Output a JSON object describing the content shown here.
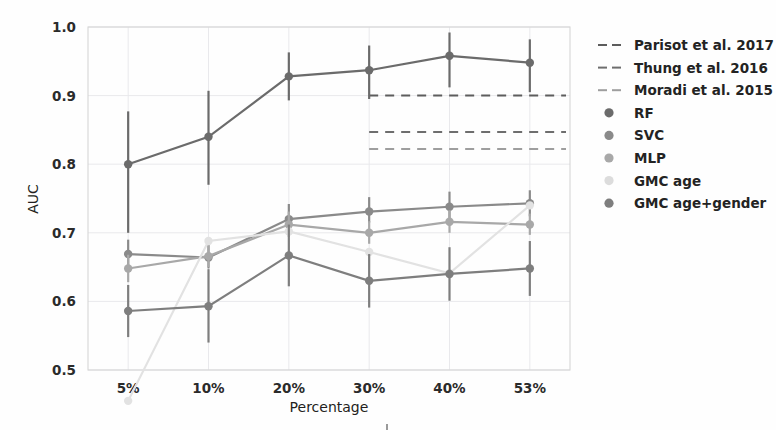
{
  "chart_data": {
    "type": "line",
    "title": "",
    "xlabel": "Percentage",
    "ylabel": "AUC",
    "categories": [
      "5%",
      "10%",
      "20%",
      "30%",
      "40%",
      "53%"
    ],
    "ylim": [
      0.5,
      1.0
    ],
    "yticks": [
      "0.5",
      "0.6",
      "0.7",
      "0.8",
      "0.9",
      "1.0"
    ],
    "ytick_values": [
      0.5,
      0.6,
      0.7,
      0.8,
      0.9,
      1.0
    ],
    "grid": true,
    "legend_position": "right-outside",
    "series": [
      {
        "name": "RF",
        "marker": "circle",
        "color": "#6b6b6b",
        "values": [
          0.8,
          0.84,
          0.928,
          0.937,
          0.958,
          0.948
        ],
        "err_low": [
          0.7,
          0.77,
          0.893,
          0.895,
          0.912,
          0.905
        ],
        "err_high": [
          0.877,
          0.907,
          0.963,
          0.973,
          0.992,
          0.982
        ]
      },
      {
        "name": "SVC",
        "marker": "circle",
        "color": "#8a8a8a",
        "values": [
          0.669,
          0.664,
          0.72,
          0.731,
          0.738,
          0.743
        ],
        "err_low": [
          0.648,
          0.648,
          0.7,
          0.715,
          0.718,
          0.724
        ],
        "err_high": [
          0.69,
          0.682,
          0.742,
          0.752,
          0.76,
          0.762
        ]
      },
      {
        "name": "MLP",
        "marker": "circle",
        "color": "#a8a8a8",
        "values": [
          0.648,
          0.666,
          0.712,
          0.7,
          0.716,
          0.712
        ],
        "err_low": [
          0.628,
          0.65,
          0.694,
          0.684,
          0.7,
          0.697
        ],
        "err_high": [
          0.668,
          0.683,
          0.731,
          0.717,
          0.733,
          0.728
        ]
      },
      {
        "name": "GMC age",
        "marker": "circle",
        "color": "#e2e2e2",
        "values": [
          0.455,
          0.688,
          0.702,
          0.672,
          0.641,
          0.74
        ],
        "err_low": [
          0.455,
          0.688,
          0.702,
          0.672,
          0.641,
          0.74
        ],
        "err_high": [
          0.455,
          0.688,
          0.702,
          0.672,
          0.641,
          0.74
        ]
      },
      {
        "name": "GMC age+gender",
        "marker": "circle",
        "color": "#7e7e7e",
        "values": [
          0.586,
          0.593,
          0.667,
          0.63,
          0.64,
          0.648
        ],
        "err_low": [
          0.548,
          0.54,
          0.622,
          0.591,
          0.601,
          0.608
        ],
        "err_high": [
          0.624,
          0.647,
          0.712,
          0.669,
          0.679,
          0.688
        ]
      }
    ],
    "reference_lines": [
      {
        "name": "Parisot et al. 2017",
        "value": 0.9,
        "color": "#5d5d5d",
        "style": "dashed"
      },
      {
        "name": "Thung et al. 2016",
        "value": 0.847,
        "color": "#6e6e6e",
        "style": "dashed"
      },
      {
        "name": "Moradi et al. 2015",
        "value": 0.822,
        "color": "#9e9e9e",
        "style": "dashed"
      }
    ]
  },
  "legend": {
    "entries": [
      {
        "label": "Parisot et al. 2017",
        "kind": "dashed",
        "color": "#5d5d5d"
      },
      {
        "label": "Thung et al. 2016",
        "kind": "dashed",
        "color": "#6e6e6e"
      },
      {
        "label": "Moradi et al. 2015",
        "kind": "dashed",
        "color": "#9e9e9e"
      },
      {
        "label": "RF",
        "kind": "marker",
        "color": "#6b6b6b"
      },
      {
        "label": "SVC",
        "kind": "marker",
        "color": "#8a8a8a"
      },
      {
        "label": "MLP",
        "kind": "marker",
        "color": "#a8a8a8"
      },
      {
        "label": "GMC age",
        "kind": "marker",
        "color": "#dcdcdc"
      },
      {
        "label": "GMC age+gender",
        "kind": "marker",
        "color": "#7e7e7e"
      }
    ]
  }
}
